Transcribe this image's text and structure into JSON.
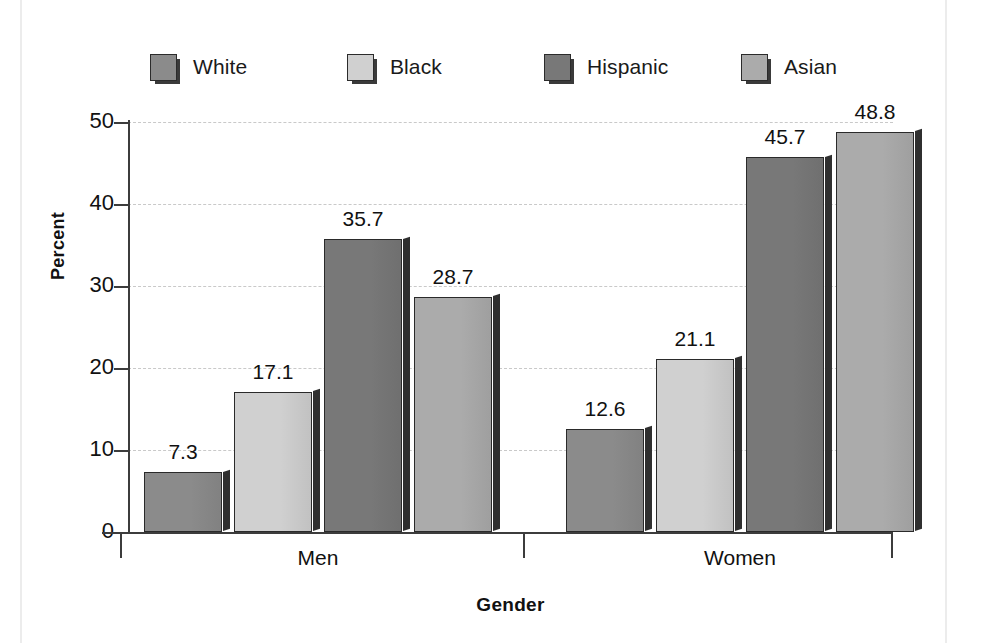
{
  "chart_data": {
    "type": "bar",
    "title": "",
    "xlabel": "Gender",
    "ylabel": "Percent",
    "categories": [
      "Men",
      "Women"
    ],
    "ylim": [
      0,
      50
    ],
    "yticks": [
      0,
      10,
      20,
      30,
      40,
      50
    ],
    "ytick_labels": [
      "0",
      "10",
      "20",
      "30",
      "40",
      "50"
    ],
    "grid": true,
    "legend_position": "top",
    "series": [
      {
        "name": "White",
        "color": "#8b8b8b",
        "values": [
          7.3,
          12.6
        ]
      },
      {
        "name": "Black",
        "color": "#d0d0d0",
        "values": [
          17.1,
          21.1
        ]
      },
      {
        "name": "Hispanic",
        "color": "#787878",
        "values": [
          35.7,
          45.7
        ]
      },
      {
        "name": "Asian",
        "color": "#ababab",
        "values": [
          28.7,
          48.8
        ]
      }
    ],
    "data_labels": [
      "7.3",
      "17.1",
      "35.7",
      "28.7",
      "12.6",
      "21.1",
      "45.7",
      "48.8"
    ]
  },
  "legend": {
    "items": [
      {
        "label": "White"
      },
      {
        "label": "Black"
      },
      {
        "label": "Hispanic"
      },
      {
        "label": "Asian"
      }
    ]
  },
  "axes": {
    "y_label": "Percent",
    "x_label": "Gender",
    "y_ticks": [
      "50",
      "40",
      "30",
      "20",
      "10",
      "0"
    ],
    "x_groups": [
      "Men",
      "Women"
    ]
  }
}
